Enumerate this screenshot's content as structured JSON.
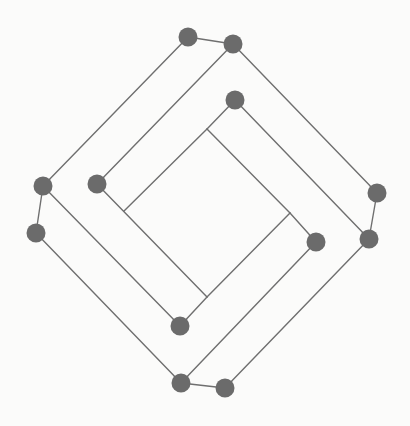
{
  "diagram": {
    "type": "graph",
    "colors": {
      "background": "#fbfbfa",
      "node": "#6b6b6b",
      "edge": "#6f6f6f"
    },
    "node_radius": 9.5,
    "nodes": [
      {
        "id": "A",
        "x": 188,
        "y": 37
      },
      {
        "id": "B",
        "x": 233,
        "y": 44
      },
      {
        "id": "C",
        "x": 235,
        "y": 100
      },
      {
        "id": "D",
        "x": 43,
        "y": 186
      },
      {
        "id": "E",
        "x": 97,
        "y": 184
      },
      {
        "id": "F",
        "x": 377,
        "y": 193
      },
      {
        "id": "G",
        "x": 36,
        "y": 233
      },
      {
        "id": "H",
        "x": 316,
        "y": 242
      },
      {
        "id": "I",
        "x": 369,
        "y": 239
      },
      {
        "id": "J",
        "x": 180,
        "y": 326
      },
      {
        "id": "K",
        "x": 181,
        "y": 383
      },
      {
        "id": "L",
        "x": 225,
        "y": 388
      }
    ],
    "junctions": [
      {
        "id": "P1",
        "x": 207,
        "y": 129
      },
      {
        "id": "P2",
        "x": 124,
        "y": 211
      },
      {
        "id": "P3",
        "x": 290,
        "y": 213
      },
      {
        "id": "P4",
        "x": 207,
        "y": 297
      }
    ],
    "edges": [
      [
        "A",
        "B"
      ],
      [
        "A",
        "D"
      ],
      [
        "B",
        "E"
      ],
      [
        "B",
        "F"
      ],
      [
        "C",
        "P1"
      ],
      [
        "P1",
        "P2"
      ],
      [
        "C",
        "I"
      ],
      [
        "P1",
        "P3"
      ],
      [
        "P3",
        "H"
      ],
      [
        "D",
        "G"
      ],
      [
        "D",
        "J"
      ],
      [
        "G",
        "K"
      ],
      [
        "E",
        "P4"
      ],
      [
        "J",
        "P4"
      ],
      [
        "P4",
        "P3"
      ],
      [
        "F",
        "I"
      ],
      [
        "H",
        "K"
      ],
      [
        "I",
        "L"
      ],
      [
        "K",
        "L"
      ]
    ]
  }
}
